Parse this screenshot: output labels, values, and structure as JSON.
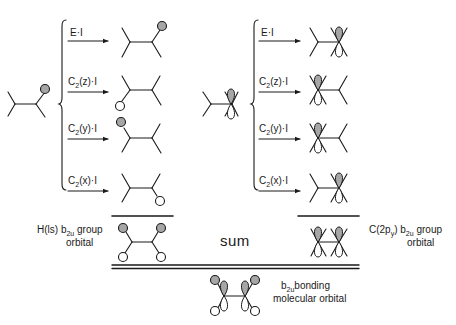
{
  "diagram": {
    "colors": {
      "ink": "#1a1a1a",
      "shaded_lobe": "#a6a6a6",
      "open_lobe": "#ffffff",
      "background": "#ffffff"
    },
    "left_column": {
      "operations": [
        {
          "op": "E",
          "sub": "",
          "arg": "",
          "suffix": "·I"
        },
        {
          "op": "C",
          "sub": "2",
          "arg": "(z)",
          "suffix": "·I"
        },
        {
          "op": "C",
          "sub": "2",
          "arg": "(y)",
          "suffix": "·I"
        },
        {
          "op": "C",
          "sub": "2",
          "arg": "(x)",
          "suffix": "·I"
        }
      ],
      "group_label_line1_pre": "H(ls)",
      "group_label_line1_b": "b",
      "group_label_line1_sub": "2u",
      "group_label_line1_post": " group",
      "group_label_line2": "orbital"
    },
    "right_column": {
      "operations": [
        {
          "op": "E",
          "sub": "",
          "arg": "",
          "suffix": "·I"
        },
        {
          "op": "C",
          "sub": "2",
          "arg": "(z)",
          "suffix": "·I"
        },
        {
          "op": "C",
          "sub": "2",
          "arg": "(y)",
          "suffix": "·I"
        },
        {
          "op": "C",
          "sub": "2",
          "arg": "(x)",
          "suffix": "·I"
        }
      ],
      "group_label_line1_pre": "C(2p",
      "group_label_line1_psub": "y",
      "group_label_line1_mid": ") b",
      "group_label_line1_sub": "2u",
      "group_label_line1_post": " group",
      "group_label_line2": "orbital"
    },
    "sum_label": "sum",
    "result": {
      "line1_b": "b",
      "line1_sub": "2u",
      "line1_post": "bonding",
      "line2": "molecular orbital"
    }
  }
}
